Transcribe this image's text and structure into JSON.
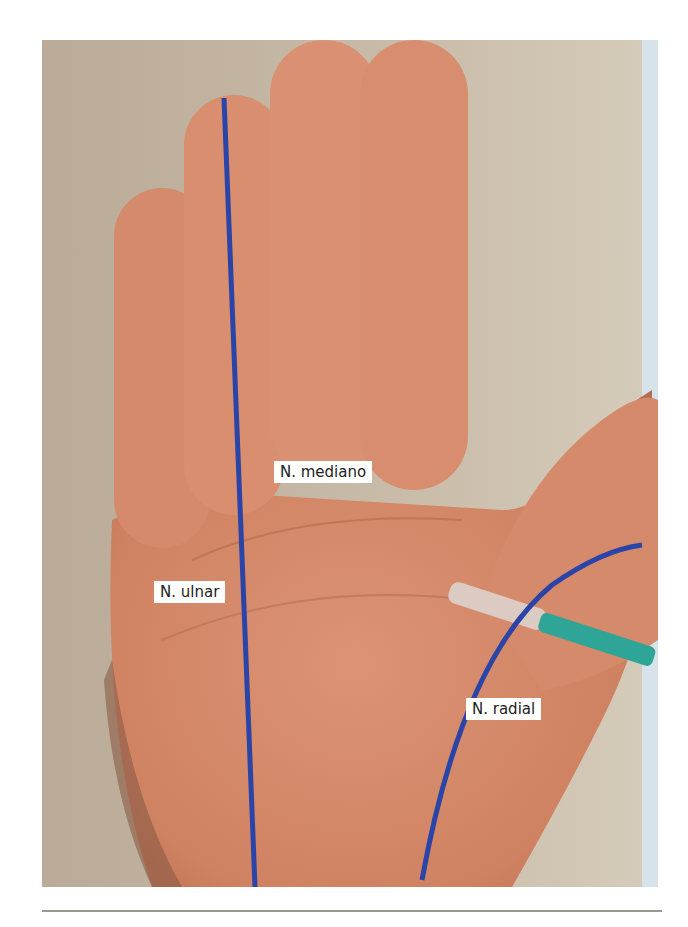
{
  "figure": {
    "labels": {
      "median": "N. mediano",
      "ulnar": "N. ulnar",
      "radial": "N. radial"
    },
    "colors": {
      "nerve_line": "#2a44a8",
      "skin": "#d98b6c",
      "background": "#c4b8a6",
      "syringe_plunger": "#2fa598",
      "syringe_barrel": "#d8c8c0"
    }
  },
  "caption": {
    "text": ""
  }
}
